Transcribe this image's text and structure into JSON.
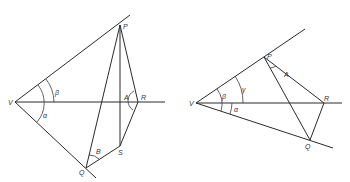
{
  "figure": {
    "left_diagram": {
      "points": {
        "V": {
          "label": "V",
          "x": 15,
          "y": 102
        },
        "P": {
          "label": "P",
          "x": 120,
          "y": 25
        },
        "A": {
          "label": "A",
          "x": 120,
          "y": 102
        },
        "R": {
          "label": "R",
          "x": 138,
          "y": 102
        },
        "S": {
          "label": "S",
          "x": 120,
          "y": 146
        },
        "Q": {
          "label": "Q",
          "x": 86,
          "y": 168
        }
      },
      "angle_labels": {
        "beta_upper": "β",
        "alpha": "α",
        "beta_lower": "B",
        "a_at_r": "A"
      }
    },
    "right_diagram": {
      "points": {
        "V": {
          "label": "V",
          "x": 196,
          "y": 103
        },
        "P": {
          "label": "P",
          "x": 264,
          "y": 57
        },
        "R": {
          "label": "R",
          "x": 324,
          "y": 103
        },
        "Q": {
          "label": "Q",
          "x": 310,
          "y": 140
        }
      },
      "angle_labels": {
        "beta": "β",
        "gamma": "γ",
        "alpha": "α",
        "a_at_p": "A"
      }
    },
    "colors": {
      "line": "#2a2a2a",
      "label": "#333333",
      "background": "#ffffff"
    }
  }
}
